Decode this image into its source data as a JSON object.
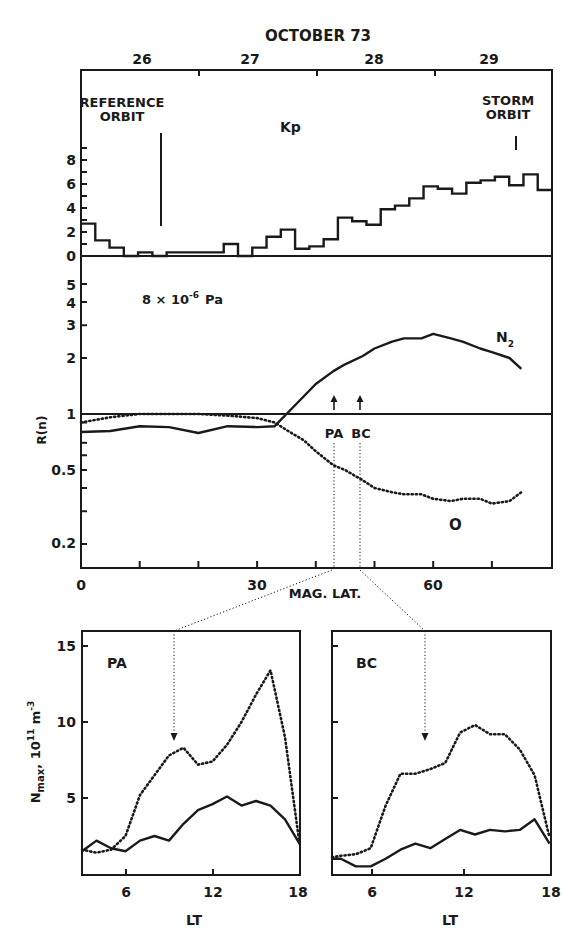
{
  "figure": {
    "top_title": "OCTOBER 73",
    "day_labels": [
      "26",
      "27",
      "28",
      "29"
    ],
    "reference_label_1": "REFERENCE",
    "reference_label_2": "ORBIT",
    "storm_label_1": "STORM",
    "storm_label_2": "ORBIT",
    "kp_label": "Kp",
    "pressure_label": "8 × 10",
    "pressure_exp": "-6",
    "pressure_unit": "Pa",
    "n2_label": "N",
    "n2_sub": "2",
    "o_label": "O",
    "pa_marker": "PA",
    "bc_marker": "BC",
    "r_axis_label": "R(n)",
    "mag_lat_label": "MAG. LAT.",
    "nmax_label": "N",
    "nmax_sub": "max",
    "nmax_units": ", 10",
    "nmax_exp1": "11",
    "nmax_unit2": " m",
    "nmax_exp2": "-3",
    "pa_panel_label": "PA",
    "bc_panel_label": "BC",
    "lt_label": "LT"
  },
  "chart_data": [
    {
      "type": "line",
      "title": "Kp index, October 1973",
      "subtitle": "step plot, 3-hour values",
      "xlabel": "OCTOBER 73 (day)",
      "ylabel": "Kp",
      "x_tick_labels": [
        "26",
        "27",
        "28",
        "29"
      ],
      "y_ticks": [
        0,
        2,
        4,
        6,
        8
      ],
      "ylim": [
        0,
        9
      ],
      "annotations": [
        "REFERENCE ORBIT",
        "STORM ORBIT",
        "Kp"
      ],
      "series": [
        {
          "name": "Kp",
          "values": [
            2.7,
            1.3,
            0.7,
            0,
            0.3,
            0,
            0.3,
            0.3,
            0.3,
            0.3,
            1.0,
            0,
            0.7,
            1.6,
            2.2,
            0.6,
            0.8,
            1.4,
            3.2,
            2.9,
            2.6,
            3.9,
            4.2,
            4.8,
            5.8,
            5.6,
            5.2,
            6.1,
            6.3,
            6.6,
            5.9,
            6.8,
            5.5
          ]
        }
      ]
    },
    {
      "type": "line",
      "title": "R(n) vs magnetic latitude",
      "annotation": "8 × 10^-6 Pa",
      "xlabel": "MAG. LAT.",
      "ylabel": "R(n)",
      "x_ticks": [
        0,
        30,
        60
      ],
      "xlim": [
        0,
        80
      ],
      "y_scale": "log",
      "y_ticks": [
        0.2,
        0.5,
        1,
        2,
        3,
        4,
        5
      ],
      "ylim": [
        0.15,
        6
      ],
      "reference_line": 1,
      "markers": [
        {
          "label": "PA",
          "x": 43
        },
        {
          "label": "BC",
          "x": 48
        }
      ],
      "x": [
        0,
        5,
        10,
        15,
        20,
        25,
        30,
        33,
        35,
        38,
        40,
        43,
        45,
        48,
        50,
        53,
        55,
        58,
        60,
        63,
        65,
        68,
        70,
        73,
        75
      ],
      "series": [
        {
          "name": "N2",
          "style": "solid",
          "values": [
            0.8,
            0.81,
            0.86,
            0.85,
            0.79,
            0.86,
            0.85,
            0.86,
            1.0,
            1.25,
            1.45,
            1.7,
            1.85,
            2.05,
            2.25,
            2.45,
            2.55,
            2.55,
            2.7,
            2.55,
            2.45,
            2.25,
            2.15,
            2.0,
            1.75
          ]
        },
        {
          "name": "O",
          "style": "dotted",
          "values": [
            0.9,
            0.96,
            1.0,
            1.0,
            1.0,
            0.98,
            0.95,
            0.9,
            0.82,
            0.72,
            0.63,
            0.53,
            0.5,
            0.44,
            0.4,
            0.38,
            0.37,
            0.37,
            0.35,
            0.34,
            0.35,
            0.35,
            0.33,
            0.34,
            0.38
          ]
        }
      ]
    },
    {
      "type": "line",
      "title": "PA",
      "xlabel": "LT",
      "ylabel": "Nmax, 10^11 m^-3",
      "x_ticks": [
        6,
        12,
        18
      ],
      "xlim": [
        3,
        18
      ],
      "y_ticks": [
        5,
        10,
        15
      ],
      "ylim": [
        0,
        16
      ],
      "arrow_at_lt": 9,
      "x": [
        3,
        4,
        5,
        6,
        7,
        8,
        9,
        10,
        11,
        12,
        13,
        14,
        15,
        16,
        17,
        18
      ],
      "series": [
        {
          "name": "storm (dotted)",
          "style": "dotted",
          "values": [
            1.6,
            1.4,
            1.6,
            2.5,
            5.2,
            6.5,
            7.8,
            8.3,
            7.2,
            7.4,
            8.5,
            10.0,
            11.8,
            13.4,
            9.0,
            2.0
          ]
        },
        {
          "name": "reference (solid)",
          "style": "solid",
          "values": [
            1.5,
            2.2,
            1.7,
            1.5,
            2.2,
            2.5,
            2.2,
            3.3,
            4.2,
            4.6,
            5.1,
            4.5,
            4.8,
            4.5,
            3.6,
            2.0
          ]
        }
      ]
    },
    {
      "type": "line",
      "title": "BC",
      "xlabel": "LT",
      "ylabel": "Nmax, 10^11 m^-3",
      "x_ticks": [
        6,
        12,
        18
      ],
      "xlim": [
        3.4,
        18
      ],
      "y_ticks": [
        5,
        10,
        15
      ],
      "ylim": [
        0,
        16
      ],
      "arrow_at_lt": 9.4,
      "x": [
        3.4,
        4,
        5,
        6,
        7,
        8,
        9,
        10,
        11,
        12,
        13,
        14,
        15,
        16,
        17,
        18
      ],
      "series": [
        {
          "name": "storm (dotted)",
          "style": "dotted",
          "values": [
            1.1,
            1.2,
            1.3,
            1.7,
            4.5,
            6.6,
            6.6,
            6.9,
            7.3,
            9.3,
            9.8,
            9.2,
            9.2,
            8.2,
            6.5,
            2.4
          ]
        },
        {
          "name": "reference (solid)",
          "style": "solid",
          "values": [
            1.0,
            1.0,
            0.5,
            0.5,
            1.0,
            1.6,
            2.0,
            1.7,
            2.3,
            2.9,
            2.6,
            2.9,
            2.8,
            2.9,
            3.6,
            2.0
          ]
        }
      ]
    }
  ]
}
